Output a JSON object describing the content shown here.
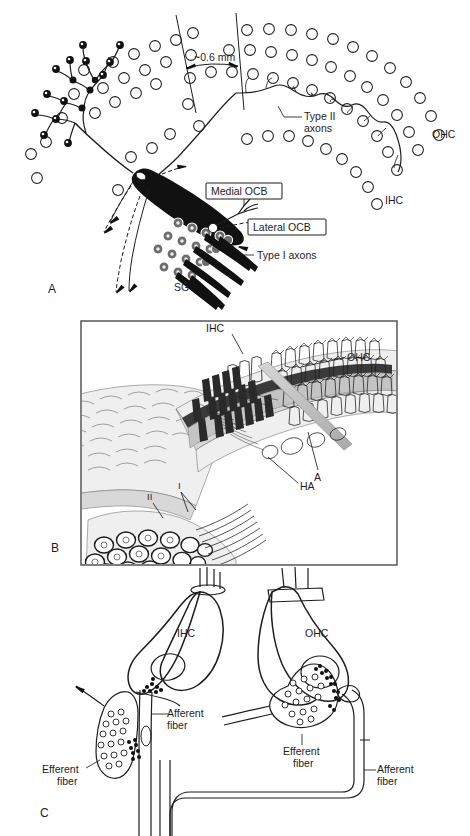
{
  "figure": {
    "panels": [
      {
        "id": "A",
        "label": "A"
      },
      {
        "id": "B",
        "label": "B"
      },
      {
        "id": "C",
        "label": "C"
      }
    ]
  },
  "panel_a": {
    "label": "A",
    "labels": {
      "distance": "~0.6 mm",
      "type2_axons_line1": "Type II",
      "type2_axons_line2": "axons",
      "ohc": "OHC",
      "ihc": "IHC",
      "medial_ocb": "Medial OCB",
      "lateral_ocb": "Lateral OCB",
      "type1_axons": "Type I axons",
      "sg": "SG"
    }
  },
  "panel_b": {
    "label": "B",
    "labels": {
      "ihc": "IHC",
      "ohc": "OHC",
      "a": "A",
      "ha": "HA",
      "type1": "I",
      "type2": "II"
    }
  },
  "panel_c": {
    "label": "C",
    "labels": {
      "ihc": "IHC",
      "ohc": "OHC",
      "afferent_left_line1": "Afferent",
      "afferent_left_line2": "fiber",
      "efferent_left_line1": "Efferent",
      "efferent_left_line2": "fiber",
      "efferent_right_line1": "Efferent",
      "efferent_right_line2": "fiber",
      "afferent_right_line1": "Afferent",
      "afferent_right_line2": "fiber"
    }
  },
  "colors": {
    "ink": "#1d1d1d",
    "paper": "#ffffff",
    "fill_dark": "#111111",
    "gray_bar": "#b9b9b9",
    "frame": "#4a4a4a"
  }
}
